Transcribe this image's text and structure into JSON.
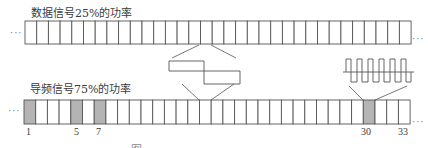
{
  "diagram": {
    "data_signal": {
      "label": "数据信号25%的功率",
      "cell_count": 33,
      "highlighted_cells": [],
      "leading_ellipsis": "···",
      "trailing_ellipsis": "···"
    },
    "pilot_signal": {
      "label": "导频信号75%的功率",
      "cell_count": 33,
      "highlighted_cells": [
        1,
        5,
        7,
        30
      ],
      "cell_number_labels": [
        "1",
        "5",
        "7",
        "30",
        "33"
      ],
      "leading_ellipsis": "···",
      "trailing_ellipsis": "···"
    },
    "waveforms": [
      {
        "name": "low-frequency-waveform",
        "description": "slow square wave linking data cell 16 to pilot cell 16"
      },
      {
        "name": "high-frequency-waveform",
        "description": "fast square wave (~6 pulses) linking pilot cell 30"
      }
    ],
    "colors": {
      "line": "#555555",
      "highlight_fill": "#b4b4b4",
      "text": "#3a3a3a"
    },
    "caption_fragment": "图"
  }
}
